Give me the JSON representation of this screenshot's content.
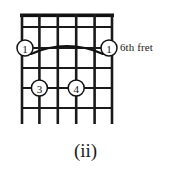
{
  "figure": {
    "kind": "guitar-chord-diagram",
    "caption": "(ii)",
    "position_label": "6th fret",
    "colors": {
      "ink": "#111111",
      "string": "#1a1a1a",
      "background": "#ffffff"
    }
  },
  "fretboard": {
    "string_count": 6,
    "fret_count": 5,
    "has_nut": true,
    "nut_style": "thick-bar",
    "grid": {
      "left": 21,
      "right": 113,
      "top": 15,
      "bottom": 124,
      "string_x": [
        21,
        39.4,
        57.8,
        76.2,
        94.6,
        113
      ],
      "fret_y": [
        15,
        27,
        48,
        68,
        88,
        108,
        124
      ]
    }
  },
  "barre": {
    "label": "1",
    "fret_row": 2,
    "from_string": 1,
    "to_string": 6,
    "shape": "arc-up",
    "left_marker": "1",
    "right_marker": "1"
  },
  "fingerings": [
    {
      "finger": "1",
      "string": 1,
      "fret_row": 2,
      "cx": 25,
      "cy": 48,
      "r": 8
    },
    {
      "finger": "1",
      "string": 6,
      "fret_row": 2,
      "cx": 109,
      "cy": 48,
      "r": 8
    },
    {
      "finger": "3",
      "string": 2,
      "fret_row": 4,
      "cx": 39.4,
      "cy": 88,
      "r": 8
    },
    {
      "finger": "4",
      "string": 4,
      "fret_row": 4,
      "cx": 76.2,
      "cy": 88,
      "r": 8
    }
  ]
}
